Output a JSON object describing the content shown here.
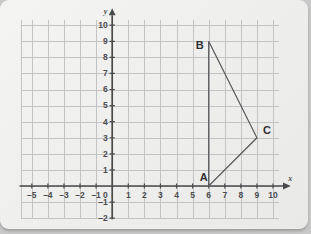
{
  "figure": {
    "type": "coordinate-grid-plot",
    "axis_x_name": "x",
    "axis_y_name": "y",
    "origin_label": "0"
  },
  "chart_data": {
    "type": "scatter",
    "title": "",
    "xlabel": "x",
    "ylabel": "y",
    "xlim": [
      -5.7,
      10.6
    ],
    "ylim": [
      -2,
      10
    ],
    "grid": true,
    "legend": "none",
    "x_ticks": [
      "–5",
      "–4",
      "–3",
      "–2",
      "–1",
      "1",
      "2",
      "3",
      "4",
      "5",
      "6",
      "7",
      "8",
      "9",
      "10"
    ],
    "x_tick_values": [
      -5,
      -4,
      -3,
      -2,
      -1,
      1,
      2,
      3,
      4,
      5,
      6,
      7,
      8,
      9,
      10
    ],
    "y_ticks": [
      "–2",
      "–1",
      "1",
      "2",
      "3",
      "4",
      "5",
      "6",
      "7",
      "8",
      "9",
      "10"
    ],
    "y_tick_values": [
      -2,
      -1,
      1,
      2,
      3,
      4,
      5,
      6,
      7,
      8,
      9,
      10
    ],
    "origin_tick": "0",
    "series": [
      {
        "name": "triangle ABC",
        "closed": true,
        "points": [
          {
            "label": "A",
            "x": 6,
            "y": 0,
            "label_dx": -9,
            "label_dy": -5
          },
          {
            "label": "B",
            "x": 6,
            "y": 9,
            "label_dx": -13,
            "label_dy": 8
          },
          {
            "label": "C",
            "x": 9,
            "y": 3,
            "label_dx": 6,
            "label_dy": -4
          }
        ]
      }
    ],
    "colors": {
      "shape_stroke": "#5a5a5d",
      "gridline": "#c3c3c4",
      "axis": "#4a4a4c",
      "background": "#f1f1f0"
    }
  }
}
